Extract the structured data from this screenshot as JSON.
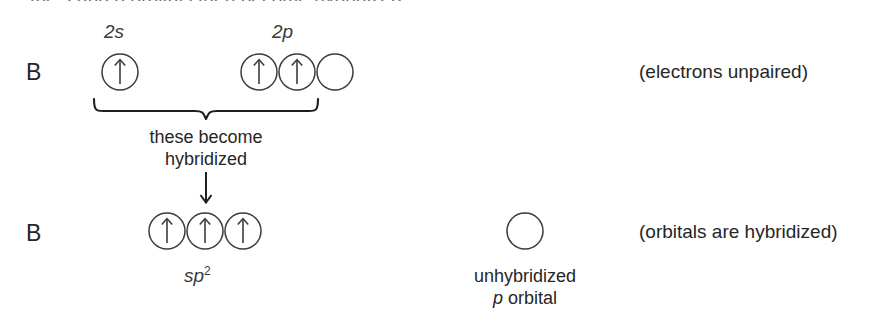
{
  "figure": {
    "caption_top": {
      "prefix": "",
      "text_plain": "the s and p orbitals then become hybridized",
      "segments": [
        {
          "t": "the ",
          "italic": false
        },
        {
          "t": "s",
          "italic": true
        },
        {
          "t": " and ",
          "italic": false
        },
        {
          "t": "p",
          "italic": true
        },
        {
          "t": " orbitals then become hybridized",
          "italic": false
        }
      ]
    },
    "row_unhybridized": {
      "atom_label": "B",
      "subshell_labels": {
        "s_label": "2s",
        "p_label": "2p"
      },
      "s_orbitals": [
        {
          "electrons": 1,
          "spins": [
            "up"
          ]
        }
      ],
      "p_orbitals": [
        {
          "electrons": 1,
          "spins": [
            "up"
          ]
        },
        {
          "electrons": 1,
          "spins": [
            "up"
          ]
        },
        {
          "electrons": 0,
          "spins": []
        }
      ],
      "annotation": "(electrons unpaired)"
    },
    "brace": {
      "caption_line1": "these become",
      "caption_line2": "hybridized",
      "arrow": "down-arrow"
    },
    "row_hybridized": {
      "atom_label": "B",
      "hybrid_label_base": "sp",
      "hybrid_label_sup": "2",
      "hybrid_orbitals": [
        {
          "electrons": 1,
          "spins": [
            "up"
          ]
        },
        {
          "electrons": 1,
          "spins": [
            "up"
          ]
        },
        {
          "electrons": 1,
          "spins": [
            "up"
          ]
        }
      ],
      "unhybridized": {
        "orbital": {
          "electrons": 0,
          "spins": []
        },
        "caption_line1": "unhybridized",
        "caption_line2_italic": "p",
        "caption_line2_rest": " orbital"
      },
      "annotation": "(orbitals are hybridized)"
    },
    "colors": {
      "background": "#ffffff",
      "ink": "#262626",
      "faded_ink": "#6e6e6e",
      "stroke": "#3c3c3c"
    }
  }
}
